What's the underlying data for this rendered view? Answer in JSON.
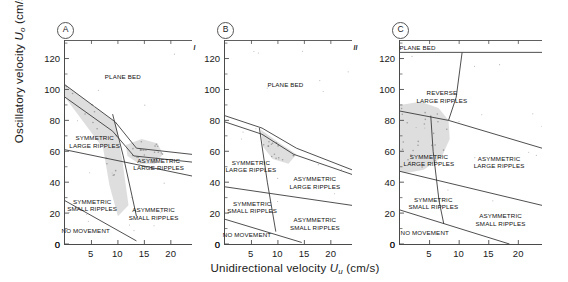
{
  "figure": {
    "axes": {
      "ylabel_pre": "Oscillatory velocity ",
      "ylabel_sym": "U",
      "ylabel_sub": "o",
      "ylabel_post": " (cm/s)",
      "xlabel_pre": "Unidirectional velocity ",
      "xlabel_sym": "U",
      "xlabel_sub": "u",
      "xlabel_post": " (cm/s)",
      "yticks": [
        "0",
        "20",
        "40",
        "60",
        "80",
        "100",
        "120"
      ],
      "ytick_values": [
        0,
        20,
        40,
        60,
        80,
        100,
        120
      ],
      "ylim": [
        0,
        132
      ],
      "xticks": [
        "5",
        "10",
        "15",
        "20"
      ],
      "xtick_values": [
        5,
        10,
        15,
        20
      ],
      "xlim": [
        0,
        24
      ],
      "xtick_zero": "0"
    },
    "colors": {
      "axis": "#4a4a4a",
      "line": "#3a3a3a",
      "shaded_field": "#d8d8d8",
      "stipple": "#8a8a8a",
      "text": "#111111"
    },
    "panels": [
      {
        "id": "A",
        "badge": "A",
        "title": "COMBINED-FLOW PHASE DIAGRAM I",
        "subtitle": "grain size: 0.14 mm, period: 10.5 s",
        "fields": [
          {
            "name": "plane-bed",
            "label": "PLANE BED",
            "x": 46,
            "y": 18
          },
          {
            "name": "symmetric-large-ripples",
            "label": "SYMMETRIC\nLARGE RIPPLES",
            "x": 24,
            "y": 48
          },
          {
            "name": "asymmetric-large-ripples",
            "label": "ASYMMETRIC\nLARGE RIPPLES",
            "x": 74,
            "y": 59
          },
          {
            "name": "symmetric-small-ripples",
            "label": "SYMMETRIC\nSMALL RIPPLES",
            "x": 22,
            "y": 79
          },
          {
            "name": "asymmetric-small-ripples",
            "label": "ASYMMETRIC\nSMALL RIPPLES",
            "x": 70,
            "y": 83
          },
          {
            "name": "no-movement",
            "label": "NO MOVEMENT",
            "x": 17,
            "y": 93
          }
        ]
      },
      {
        "id": "B",
        "badge": "B",
        "title": "COMBINED-FLOW PHASE DIAGRAM II",
        "subtitle": "grain size: 0.14 mm, period: 8.0 s",
        "fields": [
          {
            "name": "plane-bed",
            "label": "PLANE BED",
            "x": 48,
            "y": 22
          },
          {
            "name": "symmetric-large-ripples",
            "label": "SYMMETRIC\nLARGE RIPPLES",
            "x": 21,
            "y": 60
          },
          {
            "name": "asymmetric-large-ripples",
            "label": "ASYMMETRIC\nLARGE RIPPLES",
            "x": 71,
            "y": 68
          },
          {
            "name": "symmetric-small-ripples",
            "label": "SYMMETRIC\nSMALL RIPPLES",
            "x": 22,
            "y": 80
          },
          {
            "name": "asymmetric-small-ripples",
            "label": "ASYMMETRIC\nSMALL RIPPLES",
            "x": 71,
            "y": 88
          },
          {
            "name": "no-movement",
            "label": "NO MOVEMENT",
            "x": 18,
            "y": 95
          }
        ]
      },
      {
        "id": "C",
        "badge": "C",
        "title": "COMBINED-FLOW PHASE DIAGRAM III",
        "subtitle": "grain size: 0.22 mm, period: 10.5 s",
        "fields": [
          {
            "name": "plane-bed",
            "label": "PLANE BED",
            "x": 13,
            "y": 4
          },
          {
            "name": "reverse-large-ripples",
            "label": "REVERSE\nLARGE RIPPLES",
            "x": 30,
            "y": 26
          },
          {
            "name": "symmetric-large-ripples",
            "label": "SYMMETRIC\nLARGE RIPPLES",
            "x": 21,
            "y": 57
          },
          {
            "name": "asymmetric-large-ripples",
            "label": "ASYMMETRIC\nLARGE RIPPLES",
            "x": 70,
            "y": 58
          },
          {
            "name": "symmetric-small-ripples",
            "label": "SYMMETRIC\nSMALL RIPPLES",
            "x": 24,
            "y": 78
          },
          {
            "name": "asymmetric-small-ripples",
            "label": "ASYMMETRIC\nSMALL RIPPLES",
            "x": 71,
            "y": 86
          },
          {
            "name": "no-movement",
            "label": "NO MOVEMENT",
            "x": 18,
            "y": 94
          }
        ]
      }
    ]
  },
  "chart_data": {
    "type": "line",
    "xlabel": "Unidirectional velocity Uu (cm/s)",
    "ylabel": "Oscillatory velocity Uo (cm/s)",
    "xlim": [
      0,
      24
    ],
    "ylim": [
      0,
      132
    ],
    "grid": false,
    "legend": "none",
    "panels": [
      {
        "panel": "A",
        "title": "COMBINED-FLOW PHASE DIAGRAM I",
        "grain_size_mm": 0.14,
        "period_s": 10.5,
        "boundaries": [
          {
            "name": "plane-bed-upper-boundary",
            "points": [
              [
                0,
                103
              ],
              [
                9.5,
                79
              ],
              [
                13.5,
                62
              ],
              [
                24,
                58
              ]
            ]
          },
          {
            "name": "large-ripple-band-lower",
            "points": [
              [
                0,
                95
              ],
              [
                9.0,
                73
              ],
              [
                13.0,
                57
              ],
              [
                24,
                53
              ]
            ]
          },
          {
            "name": "symmetric-asymmetric-large-divide",
            "points": [
              [
                9.0,
                84
              ],
              [
                11.0,
                57
              ],
              [
                13.5,
                18
              ]
            ]
          },
          {
            "name": "large-small-ripple-divide",
            "points": [
              [
                0,
                61
              ],
              [
                24,
                44
              ]
            ]
          },
          {
            "name": "no-movement-boundary",
            "points": [
              [
                0,
                28
              ],
              [
                13.5,
                2
              ]
            ]
          }
        ],
        "shaded_regions": [
          {
            "name": "symmetric-large-ripple-shaded-band",
            "points": [
              [
                0,
                103
              ],
              [
                9.5,
                79
              ],
              [
                10.8,
                55
              ],
              [
                12.0,
                25
              ],
              [
                10.0,
                18
              ],
              [
                8.4,
                38
              ],
              [
                7.2,
                62
              ],
              [
                0,
                95
              ]
            ]
          },
          {
            "name": "asymmetric-large-ripple-shaded-lobe",
            "points": [
              [
                11.5,
                64
              ],
              [
                14.5,
                68
              ],
              [
                17.5,
                65
              ],
              [
                18.5,
                58
              ],
              [
                17.0,
                52
              ],
              [
                14.0,
                52
              ],
              [
                11.8,
                57
              ]
            ]
          }
        ]
      },
      {
        "panel": "B",
        "title": "COMBINED-FLOW PHASE DIAGRAM II",
        "grain_size_mm": 0.14,
        "period_s": 8.0,
        "boundaries": [
          {
            "name": "plane-bed-upper-boundary",
            "points": [
              [
                0,
                83
              ],
              [
                7.0,
                75
              ],
              [
                13.5,
                62
              ],
              [
                24,
                48
              ]
            ]
          },
          {
            "name": "large-ripple-band-lower",
            "points": [
              [
                0,
                79
              ],
              [
                7.0,
                71
              ],
              [
                13.0,
                58
              ],
              [
                24,
                45
              ]
            ]
          },
          {
            "name": "symmetric-asymmetric-large-divide",
            "points": [
              [
                6.5,
                75
              ],
              [
                8.0,
                40
              ],
              [
                9.6,
                8
              ]
            ]
          },
          {
            "name": "large-small-ripple-divide",
            "points": [
              [
                0,
                37
              ],
              [
                24,
                25
              ]
            ]
          },
          {
            "name": "no-movement-boundary",
            "points": [
              [
                0,
                16
              ],
              [
                14.5,
                1
              ]
            ]
          }
        ],
        "shaded_regions": [
          {
            "name": "large-ripple-shaded-lobe",
            "points": [
              [
                6.8,
                74
              ],
              [
                10.0,
                66
              ],
              [
                13.5,
                58
              ],
              [
                12.0,
                52
              ],
              [
                9.0,
                55
              ],
              [
                7.2,
                63
              ]
            ]
          }
        ]
      },
      {
        "panel": "C",
        "title": "COMBINED-FLOW PHASE DIAGRAM III",
        "grain_size_mm": 0.22,
        "period_s": 10.5,
        "boundaries": [
          {
            "name": "plane-bed-lower-boundary",
            "points": [
              [
                0,
                124
              ],
              [
                24,
                124
              ]
            ]
          },
          {
            "name": "reverse-asymmetric-divide",
            "points": [
              [
                10.5,
                124
              ],
              [
                9.5,
                95
              ],
              [
                8.2,
                80
              ]
            ]
          },
          {
            "name": "large-ripple-upper-boundary",
            "points": [
              [
                0,
                86
              ],
              [
                8.2,
                80
              ],
              [
                24,
                62
              ]
            ]
          },
          {
            "name": "symmetric-asymmetric-large-divide",
            "points": [
              [
                5.2,
                83
              ],
              [
                5.6,
                60
              ],
              [
                6.6,
                28
              ],
              [
                7.4,
                13
              ]
            ]
          },
          {
            "name": "large-small-ripple-divide",
            "points": [
              [
                0,
                47
              ],
              [
                24,
                25
              ]
            ]
          },
          {
            "name": "no-movement-boundary",
            "points": [
              [
                0,
                22
              ],
              [
                18.5,
                0
              ]
            ]
          }
        ],
        "shaded_regions": [
          {
            "name": "symmetric-large-ripple-shaded-ellipse",
            "points": [
              [
                0,
                90
              ],
              [
                3.5,
                92
              ],
              [
                6.5,
                88
              ],
              [
                8.2,
                80
              ],
              [
                8.4,
                68
              ],
              [
                7.0,
                56
              ],
              [
                4.0,
                48
              ],
              [
                1.0,
                46
              ],
              [
                0,
                47
              ]
            ]
          }
        ]
      }
    ]
  }
}
